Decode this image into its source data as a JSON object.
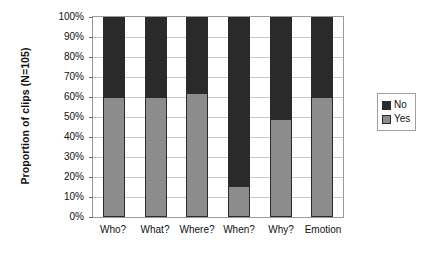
{
  "chart_data": {
    "type": "bar",
    "subtype": "stacked-100-percent",
    "title": "",
    "xlabel": "",
    "ylabel": "Proportion of clips (N=105)",
    "ylim": [
      0,
      100
    ],
    "yticks": [
      "0%",
      "10%",
      "20%",
      "30%",
      "40%",
      "50%",
      "60%",
      "70%",
      "80%",
      "90%",
      "100%"
    ],
    "ytick_values": [
      0,
      10,
      20,
      30,
      40,
      50,
      60,
      70,
      80,
      90,
      100
    ],
    "grid": true,
    "grid_axis": "y",
    "legend_position": "right",
    "categories": [
      "Who?",
      "What?",
      "Where?",
      "When?",
      "Why?",
      "Emotion"
    ],
    "series": [
      {
        "name": "No",
        "color": "#2a2a2a",
        "values": [
          40,
          40,
          38,
          85,
          51,
          40
        ]
      },
      {
        "name": "Yes",
        "color": "#8c8c8c",
        "values": [
          60,
          60,
          62,
          15,
          49,
          60
        ]
      }
    ]
  },
  "legend": {
    "items": [
      {
        "label": "No",
        "color": "#2a2a2a"
      },
      {
        "label": "Yes",
        "color": "#8c8c8c"
      }
    ]
  }
}
